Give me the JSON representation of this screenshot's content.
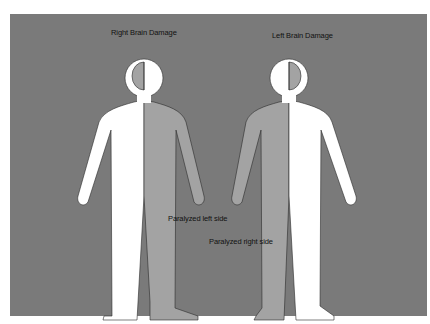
{
  "figure": {
    "colors": {
      "background": "#7a7a7a",
      "healthy": "#ffffff",
      "paralyzed": "#a3a3a3",
      "outline": "#2a2a2a"
    },
    "figures": [
      {
        "title": "Right Brain Damage",
        "paralysis_label": "Paralyzed left side",
        "damaged_hemisphere": "right",
        "paralyzed_side": "left"
      },
      {
        "title": "Left Brain Damage",
        "paralysis_label": "Paralyzed right side",
        "damaged_hemisphere": "left",
        "paralyzed_side": "right"
      }
    ]
  }
}
